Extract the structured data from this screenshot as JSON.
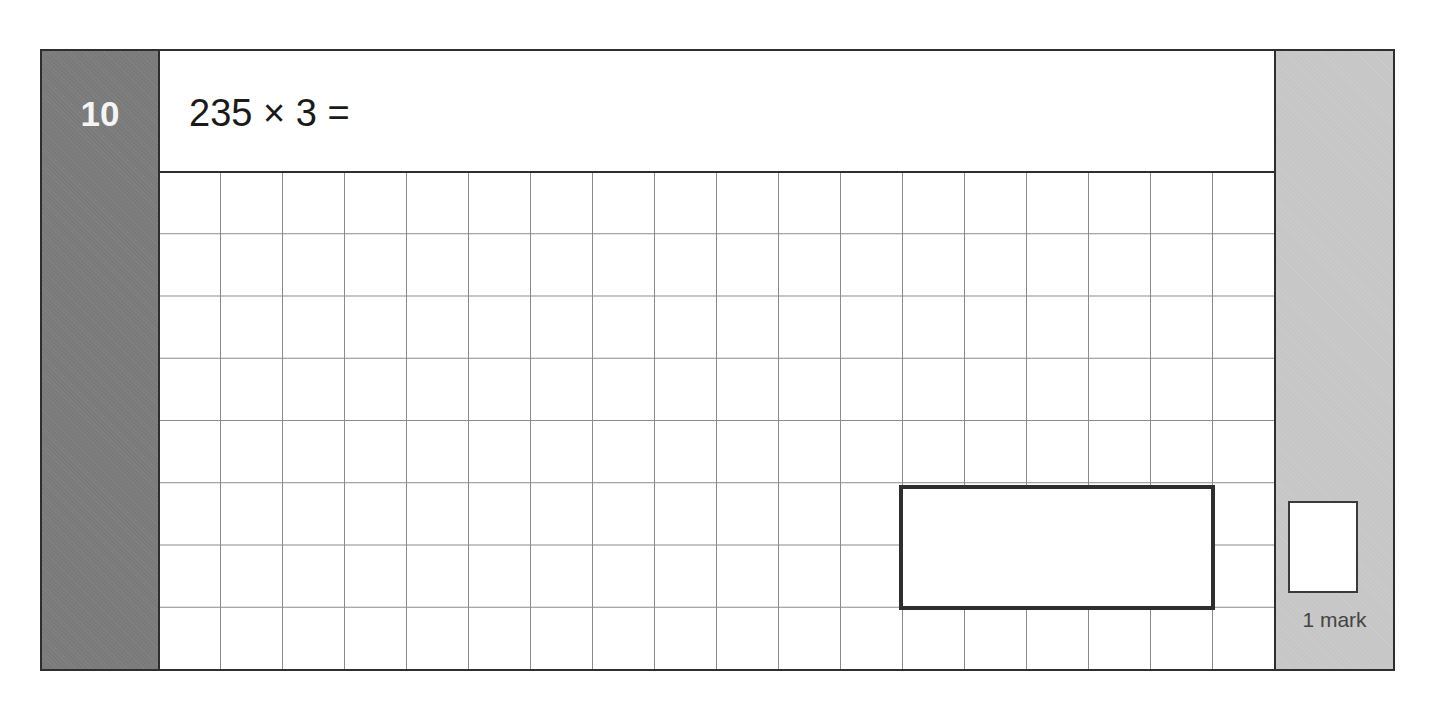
{
  "question": {
    "number": "10",
    "text": "235 × 3 =",
    "marks_label": "1 mark"
  },
  "grid": {
    "columns": 18,
    "rows": 8
  },
  "answer_box": {
    "value": ""
  },
  "colors": {
    "number_column": "#7a7a7a",
    "mark_column": "#c6c6c6",
    "border": "#2e2e2e",
    "grid_line": "#8a8a8a"
  }
}
